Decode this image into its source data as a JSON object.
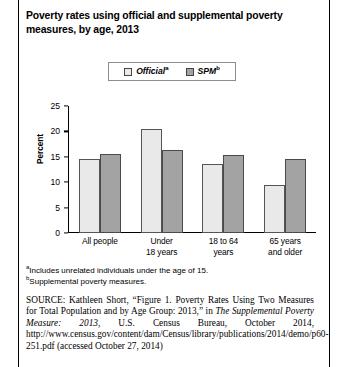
{
  "figure": {
    "title": "Poverty rates using official and supplemental poverty measures, by age, 2013"
  },
  "legend": {
    "items": [
      {
        "label": "Official",
        "marker": "a",
        "swatch_color": "#ebebeb",
        "name": "official"
      },
      {
        "label": "SPM",
        "marker": "b",
        "swatch_color": "#a3a3a3",
        "name": "spm"
      }
    ]
  },
  "footnotes": [
    {
      "marker": "a",
      "text": "Includes unrelated individuals under the age of 15."
    },
    {
      "marker": "b",
      "text": "Supplemental poverty measures."
    }
  ],
  "source": {
    "label": "SOURCE:",
    "part1": " Kathleen Short, “Figure 1. Poverty Rates Using Two Measures for Total Population and by Age Group: 2013,” in ",
    "italic1": "The Supplemental Poverty Measure: 2013",
    "part2": ", U.S. Census Bureau, October 2014, http://www.census.gov/content/dam/Census/library/publications/2014/demo/p60-251.pdf (accessed October 27, 2014)"
  },
  "chart_data": {
    "type": "bar",
    "title": "Poverty rates using official and supplemental poverty measures, by age, 2013",
    "xlabel": "",
    "ylabel": "Percent",
    "ylim": [
      0,
      25
    ],
    "yticks": [
      0,
      5,
      10,
      15,
      20,
      25
    ],
    "ytick_labels": [
      "0",
      "5",
      "10",
      "15",
      "20",
      "25"
    ],
    "grid": false,
    "legend_position": "top-center",
    "categories": [
      "All people",
      "Under 18 years",
      "18 to 64 years",
      "65 years and older"
    ],
    "category_lines": [
      [
        "All people"
      ],
      [
        "Under",
        "18 years"
      ],
      [
        "18 to 64",
        "years"
      ],
      [
        "65 years",
        "and older"
      ]
    ],
    "series": [
      {
        "name": "Official",
        "color": "#e9e9e9",
        "values": [
          14.6,
          20.4,
          13.6,
          9.5
        ]
      },
      {
        "name": "SPM",
        "color": "#a3a3a3",
        "values": [
          15.5,
          16.4,
          15.4,
          14.6
        ]
      }
    ]
  }
}
